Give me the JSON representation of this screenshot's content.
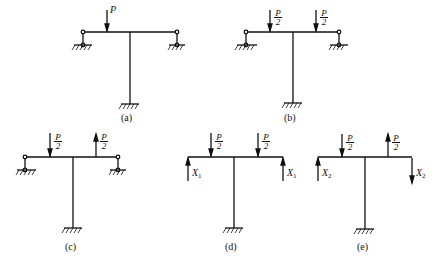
{
  "panels": [
    {
      "id": "a",
      "caption": "(a)",
      "load": "P"
    },
    {
      "id": "b",
      "caption": "(b)",
      "load_num": "P",
      "load_den": "2"
    },
    {
      "id": "c",
      "caption": "(c)",
      "load_num": "P",
      "load_den": "2"
    },
    {
      "id": "d",
      "caption": "(d)",
      "load_num": "P",
      "load_den": "2",
      "redundant": "X",
      "redundant_sub": "1"
    },
    {
      "id": "e",
      "caption": "(e)",
      "load_num": "P",
      "load_den": "2",
      "redundant": "X",
      "redundant_sub": "2"
    }
  ]
}
